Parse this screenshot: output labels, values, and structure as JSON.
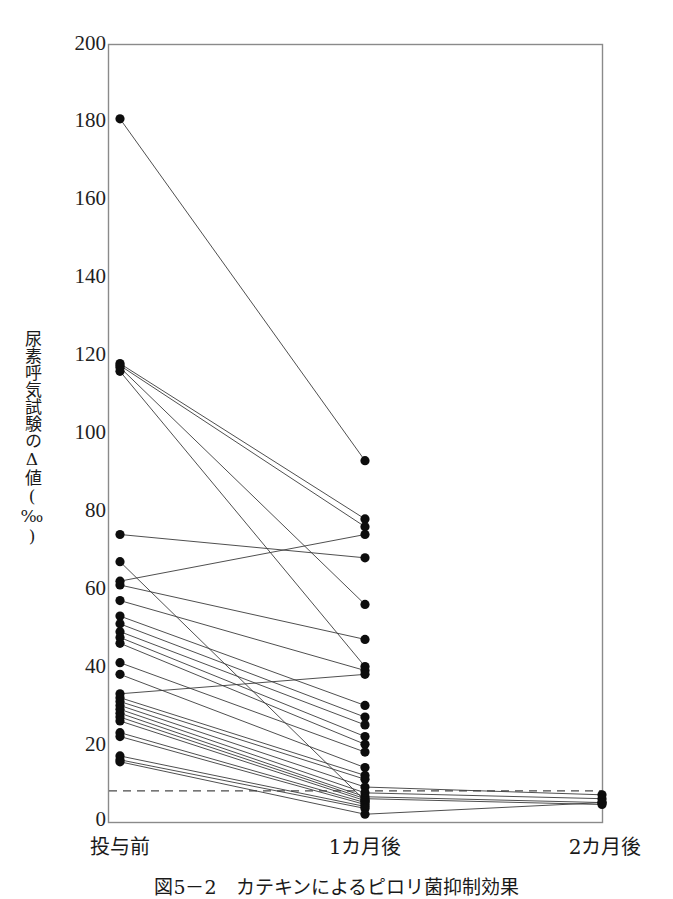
{
  "figure": {
    "caption": "図5－2　カテキンによるピロリ菌抑制効果",
    "y_axis_title": "尿素呼気試験のΔ値(‰)"
  },
  "chart_data": {
    "type": "line",
    "title": "",
    "subtitle": "",
    "xlabel": "",
    "ylabel": "尿素呼気試験のΔ値(‰)",
    "categories": [
      "投与前",
      "1カ月後",
      "2カ月後"
    ],
    "x_tick_labels": [
      "投与前",
      "1カ月後",
      "2カ月後"
    ],
    "y_tick_labels": [
      "0",
      "20",
      "40",
      "60",
      "80",
      "100",
      "120",
      "140",
      "160",
      "180",
      "200"
    ],
    "y_ticks": [
      0,
      20,
      40,
      60,
      80,
      100,
      120,
      140,
      160,
      180,
      200
    ],
    "ylim": [
      0,
      200
    ],
    "grid": false,
    "legend": "none",
    "marker": "filled-circle",
    "annotations": [
      {
        "name": "cutoff-line",
        "type": "horizontal-dashed-line",
        "value": 8,
        "label": ""
      }
    ],
    "series": [
      {
        "name": "subject-01",
        "values": [
          181,
          93,
          null
        ]
      },
      {
        "name": "subject-02",
        "values": [
          118,
          78,
          null
        ]
      },
      {
        "name": "subject-03",
        "values": [
          117.5,
          76,
          null
        ]
      },
      {
        "name": "subject-04",
        "values": [
          117,
          56,
          null
        ]
      },
      {
        "name": "subject-05",
        "values": [
          116,
          40,
          null
        ]
      },
      {
        "name": "subject-06",
        "values": [
          74,
          68,
          null
        ]
      },
      {
        "name": "subject-07",
        "values": [
          67,
          5.5,
          null
        ]
      },
      {
        "name": "subject-08",
        "values": [
          62,
          74,
          null
        ]
      },
      {
        "name": "subject-09",
        "values": [
          61,
          47,
          null
        ]
      },
      {
        "name": "subject-10",
        "values": [
          57,
          39,
          null
        ]
      },
      {
        "name": "subject-11",
        "values": [
          53,
          30,
          null
        ]
      },
      {
        "name": "subject-12",
        "values": [
          51,
          27,
          null
        ]
      },
      {
        "name": "subject-13",
        "values": [
          49,
          25,
          null
        ]
      },
      {
        "name": "subject-14",
        "values": [
          47.5,
          22,
          null
        ]
      },
      {
        "name": "subject-15",
        "values": [
          46,
          20,
          null
        ]
      },
      {
        "name": "subject-16",
        "values": [
          41,
          18,
          null
        ]
      },
      {
        "name": "subject-17",
        "values": [
          38,
          14,
          null
        ]
      },
      {
        "name": "subject-18",
        "values": [
          33,
          38,
          null
        ]
      },
      {
        "name": "subject-19",
        "values": [
          32,
          12,
          null
        ]
      },
      {
        "name": "subject-20",
        "values": [
          31,
          11,
          null
        ]
      },
      {
        "name": "subject-21",
        "values": [
          30,
          9,
          7
        ]
      },
      {
        "name": "subject-22",
        "values": [
          29,
          7.5,
          6
        ]
      },
      {
        "name": "subject-23",
        "values": [
          28,
          6.5,
          5
        ]
      },
      {
        "name": "subject-24",
        "values": [
          27,
          6,
          4.5
        ]
      },
      {
        "name": "subject-25",
        "values": [
          26,
          5.5,
          null
        ]
      },
      {
        "name": "subject-26",
        "values": [
          23,
          5,
          null
        ]
      },
      {
        "name": "subject-27",
        "values": [
          22,
          4.5,
          null
        ]
      },
      {
        "name": "subject-28",
        "values": [
          17,
          4,
          null
        ]
      },
      {
        "name": "subject-29",
        "values": [
          16,
          3.5,
          null
        ]
      },
      {
        "name": "subject-30",
        "values": [
          15.5,
          2,
          5
        ]
      }
    ]
  },
  "axis": {
    "y_200": "200",
    "y_180": "180",
    "y_160": "160",
    "y_140": "140",
    "y_120": "120",
    "y_100": "100",
    "y_80": "80",
    "y_60": "60",
    "y_40": "40",
    "y_20": "20",
    "y_0": "0",
    "x_0": "投与前",
    "x_1": "1カ月後",
    "x_2": "2カ月後"
  }
}
